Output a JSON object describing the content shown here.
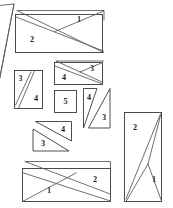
{
  "figure": {
    "background_color": "#ffffff",
    "line_color": "#3a3a3a",
    "label_color": "#1b1b1b",
    "canvas": {
      "width": 173,
      "height": 208
    },
    "shapes": [
      {
        "id": "partial-triangle-left-edge",
        "kind": "triangle",
        "label": "",
        "note": "clipped at left page margin"
      },
      {
        "id": "rect-top-large",
        "kind": "rectangle-with-diagonals",
        "label": "2",
        "secondary_label": "1"
      },
      {
        "id": "rect-mid-upper",
        "kind": "rectangle-with-diagonal",
        "label": "4",
        "secondary_label": "3"
      },
      {
        "id": "rect-left-pair",
        "kind": "rectangle-with-diagonal",
        "label": "3",
        "secondary_label": "4"
      },
      {
        "id": "square-center",
        "kind": "square",
        "label": "5"
      },
      {
        "id": "triangle-pair-right",
        "kind": "triangle-pair",
        "label": "4",
        "secondary_label": "3"
      },
      {
        "id": "triangle-pair-mid-lower",
        "kind": "triangle-pair",
        "label": "4",
        "secondary_label": "3"
      },
      {
        "id": "rect-bottom-large",
        "kind": "rectangle-with-diagonals",
        "label": "2",
        "secondary_label": "1"
      },
      {
        "id": "rect-tall-right",
        "kind": "rectangle-with-diagonals",
        "label": "2",
        "secondary_label": "1"
      }
    ],
    "labels": {
      "top_rect_main": "2",
      "top_rect_tick": "1",
      "mid_upper_left": "4",
      "mid_upper_right": "3",
      "left_pair_upper": "3",
      "left_pair_lower": "4",
      "center_square": "5",
      "right_pair_upper": "4",
      "right_pair_lower": "3",
      "mid_lower_upper": "4",
      "mid_lower_lower": "3",
      "bottom_rect_main": "2",
      "bottom_rect_tick": "1",
      "tall_rect_main": "2",
      "tall_rect_tick": "1"
    }
  }
}
